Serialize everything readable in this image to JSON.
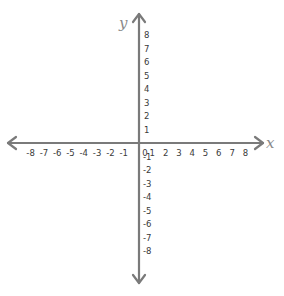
{
  "chart_data": {
    "type": "coordinate-plane",
    "title": "",
    "xlabel": "x",
    "ylabel": "y",
    "xlim": [
      -8,
      8
    ],
    "ylim": [
      -8,
      8
    ],
    "grid": false,
    "x_ticks": {
      "negative": [
        "-8",
        "-7",
        "-6",
        "-5",
        "-4",
        "-3",
        "-2",
        "-1"
      ],
      "origin": "0",
      "positive": [
        "1",
        "2",
        "3",
        "4",
        "5",
        "6",
        "7",
        "8"
      ]
    },
    "y_ticks": {
      "positive": [
        "8",
        "7",
        "6",
        "5",
        "4",
        "3",
        "2",
        "1"
      ],
      "negative": [
        "-1",
        "-2",
        "-3",
        "-4",
        "-5",
        "-6",
        "-7",
        "-8"
      ]
    },
    "arrows": [
      "left",
      "right",
      "up",
      "down"
    ],
    "colors": {
      "axis": "#7a7a7a",
      "tick_text": "#3a3a3a",
      "axis_name": "#8a8a8a"
    }
  }
}
